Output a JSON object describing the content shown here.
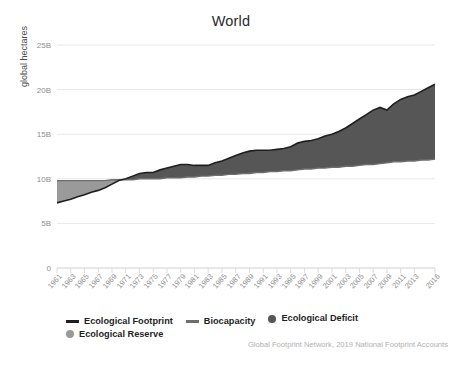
{
  "chart_data": {
    "type": "area",
    "title": "World",
    "xlabel": "",
    "ylabel": "global hectares",
    "ylim": [
      0,
      25000000000
    ],
    "xlim": [
      1961,
      2016
    ],
    "grid": true,
    "legend_position": "bottom-left",
    "ytick_labels": [
      "0",
      "5B",
      "10B",
      "15B",
      "20B",
      "25B"
    ],
    "ytick_values": [
      0,
      5000000000,
      10000000000,
      15000000000,
      20000000000,
      25000000000
    ],
    "xtick_labels": [
      "1961",
      "1963",
      "1965",
      "1967",
      "1969",
      "1971",
      "1973",
      "1975",
      "1977",
      "1979",
      "1981",
      "1983",
      "1985",
      "1987",
      "1989",
      "1991",
      "1993",
      "1995",
      "1997",
      "1999",
      "2001",
      "2003",
      "2005",
      "2007",
      "2009",
      "2011",
      "2013",
      "2016"
    ],
    "x": [
      1961,
      1962,
      1963,
      1964,
      1965,
      1966,
      1967,
      1968,
      1969,
      1970,
      1971,
      1972,
      1973,
      1974,
      1975,
      1976,
      1977,
      1978,
      1979,
      1980,
      1981,
      1982,
      1983,
      1984,
      1985,
      1986,
      1987,
      1988,
      1989,
      1990,
      1991,
      1992,
      1993,
      1994,
      1995,
      1996,
      1997,
      1998,
      1999,
      2000,
      2001,
      2002,
      2003,
      2004,
      2005,
      2006,
      2007,
      2008,
      2009,
      2010,
      2011,
      2012,
      2013,
      2014,
      2015,
      2016
    ],
    "series": [
      {
        "name": "Ecological Footprint",
        "units": "global hectares (billions)",
        "values": [
          7.3,
          7.5,
          7.7,
          8.0,
          8.2,
          8.5,
          8.7,
          9.0,
          9.4,
          9.8,
          10.0,
          10.3,
          10.6,
          10.7,
          10.7,
          11.0,
          11.2,
          11.4,
          11.6,
          11.6,
          11.5,
          11.5,
          11.5,
          11.8,
          12.0,
          12.3,
          12.6,
          12.9,
          13.1,
          13.2,
          13.2,
          13.2,
          13.3,
          13.4,
          13.6,
          14.0,
          14.2,
          14.3,
          14.5,
          14.8,
          15.0,
          15.3,
          15.7,
          16.2,
          16.7,
          17.2,
          17.7,
          18.0,
          17.7,
          18.4,
          18.9,
          19.2,
          19.4,
          19.8,
          20.2,
          20.6
        ]
      },
      {
        "name": "Biocapacity",
        "units": "global hectares (billions)",
        "values": [
          9.8,
          9.8,
          9.8,
          9.8,
          9.8,
          9.8,
          9.8,
          9.8,
          9.9,
          9.9,
          9.9,
          9.9,
          10.0,
          10.0,
          10.0,
          10.0,
          10.1,
          10.1,
          10.1,
          10.2,
          10.2,
          10.3,
          10.3,
          10.4,
          10.4,
          10.5,
          10.5,
          10.6,
          10.6,
          10.7,
          10.7,
          10.8,
          10.8,
          10.9,
          10.9,
          11.0,
          11.1,
          11.1,
          11.2,
          11.2,
          11.3,
          11.3,
          11.4,
          11.4,
          11.5,
          11.6,
          11.6,
          11.7,
          11.8,
          11.9,
          11.9,
          12.0,
          12.0,
          12.1,
          12.1,
          12.2
        ]
      }
    ],
    "regions": [
      {
        "name": "Ecological Reserve",
        "description": "Biocapacity exceeds Ecological Footprint",
        "years": "1961-1970",
        "color": "#9a9a9a"
      },
      {
        "name": "Ecological Deficit",
        "description": "Ecological Footprint exceeds Biocapacity",
        "years": "1970-2016",
        "color": "#565656"
      }
    ],
    "crossover_year": 1970
  },
  "legend": {
    "items": [
      {
        "label": "Ecological Footprint",
        "marker": "line",
        "color": "#1f1f1f"
      },
      {
        "label": "Biocapacity",
        "marker": "line",
        "color": "#6e6e6e"
      },
      {
        "label": "Ecological Deficit",
        "marker": "dot",
        "color": "#565656"
      },
      {
        "label": "Ecological Reserve",
        "marker": "dot",
        "color": "#9a9a9a"
      }
    ]
  },
  "credit": "Global Footprint Network, 2019 National Footprint Accounts",
  "colors": {
    "deficit": "#565656",
    "reserve": "#9a9a9a",
    "footprint_line": "#1f1f1f",
    "biocapacity_line": "#6e6e6e",
    "grid": "#e8e8e8",
    "tick_text": "#8d8d8d",
    "title_text": "#2b2b2b"
  }
}
